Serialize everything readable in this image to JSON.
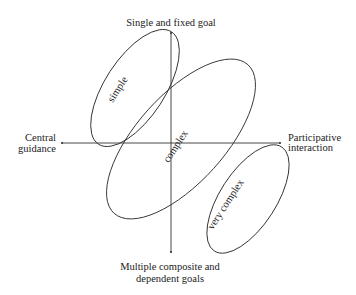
{
  "diagram": {
    "axes": {
      "top_label": "Single and fixed goal",
      "bottom_label_line1": "Multiple composite and",
      "bottom_label_line2": "dependent goals",
      "left_label_line1": "Central",
      "left_label_line2": "guidance",
      "right_label_line1": "Participative",
      "right_label_line2": "interaction"
    },
    "regions": [
      {
        "id": "simple",
        "label": "simple"
      },
      {
        "id": "complex",
        "label": "complex"
      },
      {
        "id": "very-complex",
        "label": "very complex"
      }
    ],
    "colors": {
      "line": "#333333",
      "text": "#222222",
      "background": "#ffffff"
    }
  }
}
